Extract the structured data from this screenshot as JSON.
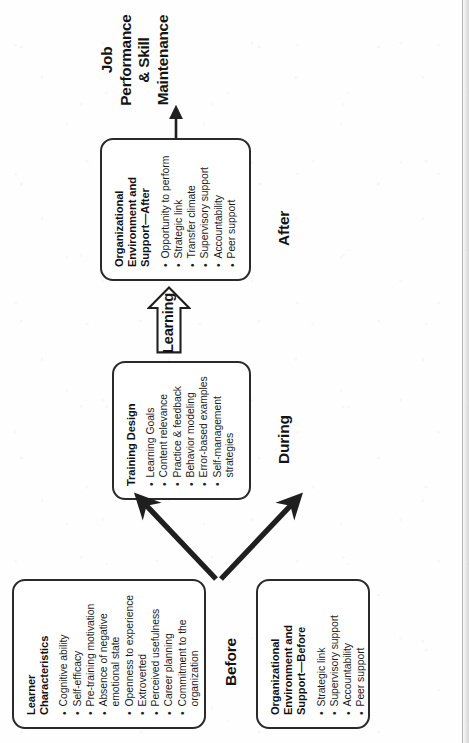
{
  "diagram": {
    "orientation": "rotated-90-ccw",
    "outcome": {
      "line1": "Job",
      "line2": "Performance",
      "line3": "& Skill",
      "line4": "Maintenance"
    },
    "phases": {
      "before": "Before",
      "during": "During",
      "after": "After"
    },
    "transition": {
      "learning": "Learning"
    },
    "nodes": [
      {
        "id": "learner-characteristics",
        "title": "Learner\nCharacteristics",
        "title_line1": "Learner",
        "title_line2": "Characteristics",
        "bullets": [
          "Cognitive ability",
          "Self-efficacy",
          "Pre-training motivation",
          "Absence of negative emotional state",
          "Openness to experience",
          "Extroverted",
          "Perceived usefulness",
          "Career planning",
          "Commitment to the organization"
        ]
      },
      {
        "id": "organizational-environment-before",
        "title_line1": "Organizational",
        "title_line2": "Environment and",
        "title_line3": "Support—Before",
        "bullets": [
          "Strategic link",
          "Supervisory support",
          "Accountability",
          "Peer support"
        ]
      },
      {
        "id": "training-design",
        "title_line1": "Training Design",
        "bullets": [
          "Learning Goals",
          "Content relevance",
          "Practice & feedback",
          "Behavior modeling",
          "Error-based examples",
          "Self-management strategies"
        ]
      },
      {
        "id": "organizational-environment-after",
        "title_line1": "Organizational",
        "title_line2": "Environment and",
        "title_line3": "Support—After",
        "bullets": [
          "Opportunity to perform",
          "Strategic link",
          "Transfer climate",
          "Supervisory support",
          "Accountability",
          "Peer support"
        ]
      }
    ],
    "colors": {
      "stroke": "#2a2a2a",
      "text": "#141414",
      "background": "#ffffff"
    }
  }
}
